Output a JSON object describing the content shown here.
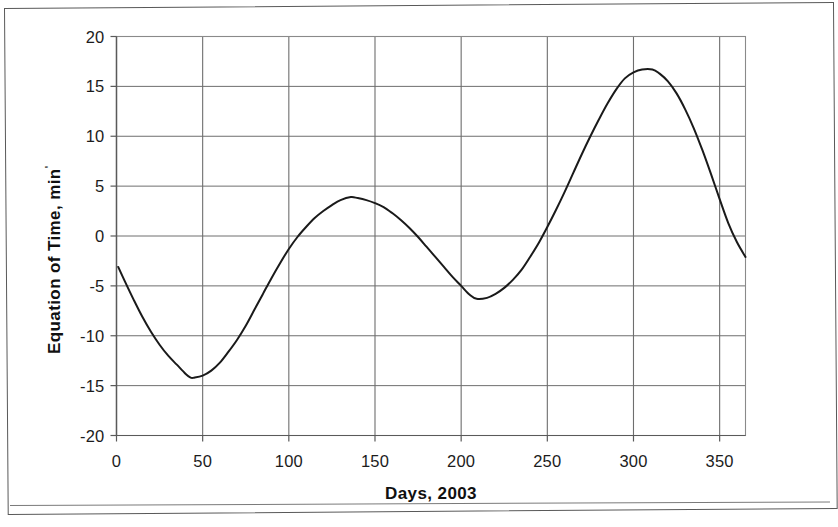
{
  "chart_data": {
    "type": "line",
    "title": "",
    "subtitle": "",
    "xlabel": "Days, 2003",
    "ylabel": "Equation of Time, min",
    "ylabel_suffix": "'",
    "xlim": [
      0,
      365
    ],
    "ylim": [
      -20,
      20
    ],
    "xticks": [
      0,
      50,
      100,
      150,
      200,
      250,
      300,
      350
    ],
    "yticks": [
      20,
      15,
      10,
      5,
      0,
      -5,
      -10,
      -15,
      -20
    ],
    "xtick_labels": [
      "0",
      "50",
      "100",
      "150",
      "200",
      "250",
      "300",
      "350"
    ],
    "ytick_labels": [
      "20",
      "15",
      "10",
      "5",
      "0",
      "-5",
      "-10",
      "-15",
      "-20"
    ],
    "grid": true,
    "grid_color": "#6e6e6e",
    "legend": "none",
    "line_color": "#1a1a1a",
    "line_width": 2.0,
    "series": [
      {
        "name": "Equation of Time",
        "x": [
          1,
          5,
          10,
          15,
          20,
          25,
          30,
          35,
          40,
          43,
          45,
          50,
          55,
          60,
          65,
          70,
          75,
          80,
          85,
          90,
          95,
          100,
          105,
          110,
          115,
          120,
          125,
          130,
          136,
          140,
          145,
          150,
          155,
          160,
          165,
          170,
          175,
          180,
          185,
          190,
          195,
          200,
          205,
          209,
          215,
          220,
          225,
          230,
          235,
          240,
          245,
          250,
          255,
          260,
          265,
          270,
          275,
          280,
          285,
          290,
          295,
          300,
          305,
          311,
          315,
          320,
          325,
          330,
          335,
          340,
          345,
          350,
          355,
          360,
          365
        ],
        "y": [
          -3.1,
          -4.6,
          -6.4,
          -8.1,
          -9.6,
          -10.9,
          -12.0,
          -12.9,
          -13.8,
          -14.2,
          -14.2,
          -14.0,
          -13.5,
          -12.7,
          -11.6,
          -10.4,
          -9.0,
          -7.4,
          -5.8,
          -4.2,
          -2.7,
          -1.3,
          -0.1,
          0.9,
          1.8,
          2.5,
          3.1,
          3.6,
          3.9,
          3.8,
          3.6,
          3.3,
          2.9,
          2.3,
          1.6,
          0.8,
          -0.1,
          -1.1,
          -2.1,
          -3.1,
          -4.1,
          -5.0,
          -5.9,
          -6.3,
          -6.2,
          -5.8,
          -5.2,
          -4.4,
          -3.4,
          -2.1,
          -0.7,
          0.9,
          2.6,
          4.4,
          6.3,
          8.2,
          10.0,
          11.7,
          13.3,
          14.7,
          15.8,
          16.4,
          16.7,
          16.7,
          16.3,
          15.5,
          14.3,
          12.7,
          10.8,
          8.6,
          6.2,
          3.7,
          1.3,
          -0.6,
          -2.1
        ]
      }
    ]
  },
  "axes": {
    "y_axis_title": "Equation of Time, min",
    "x_axis_title": "Days, 2003"
  }
}
